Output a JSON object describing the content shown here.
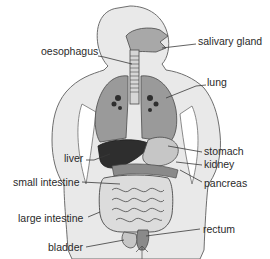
{
  "diagram": {
    "colors": {
      "body_fill": "#e9e9e9",
      "body_stroke": "#6e6e6e",
      "lung_fill": "#9a9a9a",
      "liver_fill": "#2e2e2e",
      "stomach_fill": "#c6c6c6",
      "intestine_fill": "#dcdcdc",
      "rectum_fill": "#8a8a8a",
      "text": "#2a2a2a",
      "leader": "#3a3a3a"
    },
    "labels": {
      "oesophagus": "oesophagus",
      "salivary_gland": "salivary gland",
      "lung": "lung",
      "liver": "liver",
      "stomach": "stomach",
      "kidney": "kidney",
      "small_intestine": "small intestine",
      "pancreas": "pancreas",
      "large_intestine": "large intestine",
      "rectum": "rectum",
      "bladder": "bladder"
    }
  }
}
